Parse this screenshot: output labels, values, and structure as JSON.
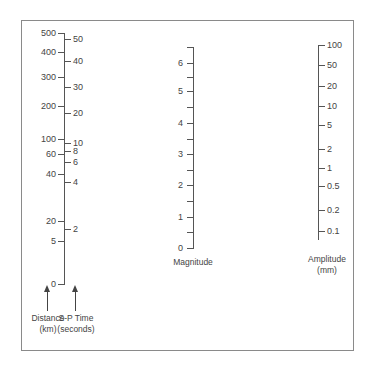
{
  "chart_data": {
    "type": "nomogram",
    "title": "",
    "scales": [
      {
        "name": "Distance",
        "unit": "km",
        "caption": "Distance\n(km)",
        "side": "left",
        "ticks": [
          {
            "label": "500",
            "y": 33
          },
          {
            "label": "400",
            "y": 52
          },
          {
            "label": "300",
            "y": 77
          },
          {
            "label": "200",
            "y": 106
          },
          {
            "label": "100",
            "y": 139
          },
          {
            "label": "60",
            "y": 154
          },
          {
            "label": "40",
            "y": 174
          },
          {
            "label": "20",
            "y": 221
          },
          {
            "label": "5",
            "y": 241
          },
          {
            "label": "0",
            "y": 284
          }
        ]
      },
      {
        "name": "S-P Time",
        "unit": "seconds",
        "caption": "S-P Time\n(seconds)",
        "side": "right",
        "ticks": [
          {
            "label": "50",
            "y": 39
          },
          {
            "label": "40",
            "y": 61
          },
          {
            "label": "30",
            "y": 87
          },
          {
            "label": "20",
            "y": 113
          },
          {
            "label": "10",
            "y": 143
          },
          {
            "label": "8",
            "y": 151
          },
          {
            "label": "6",
            "y": 162
          },
          {
            "label": "4",
            "y": 182
          },
          {
            "label": "2",
            "y": 229
          }
        ]
      },
      {
        "name": "Magnitude",
        "caption": "Magnitude",
        "ticks": [
          {
            "label": "6",
            "y": 63
          },
          {
            "label": "5",
            "y": 91
          },
          {
            "label": "4",
            "y": 123
          },
          {
            "label": "3",
            "y": 154
          },
          {
            "label": "2",
            "y": 185
          },
          {
            "label": "1",
            "y": 217
          },
          {
            "label": "0",
            "y": 248
          }
        ],
        "minor_ticks_y": [
          47,
          77,
          107,
          139,
          170,
          201,
          232
        ]
      },
      {
        "name": "Amplitude",
        "unit": "mm",
        "caption": "Amplitude\n(mm)",
        "ticks": [
          {
            "label": "100",
            "y": 45
          },
          {
            "label": "50",
            "y": 65
          },
          {
            "label": "20",
            "y": 86
          },
          {
            "label": "10",
            "y": 106
          },
          {
            "label": "5",
            "y": 125
          },
          {
            "label": "2",
            "y": 149
          },
          {
            "label": "1",
            "y": 168
          },
          {
            "label": "0.5",
            "y": 186
          },
          {
            "label": "0.2",
            "y": 210
          },
          {
            "label": "0.1",
            "y": 231
          }
        ]
      }
    ]
  },
  "labels": {
    "distance_caption_1": "Distance",
    "distance_caption_2": "(km)",
    "sp_caption_1": "S-P Time",
    "sp_caption_2": "(seconds)",
    "magnitude_caption": "Magnitude",
    "amplitude_caption_1": "Amplitude",
    "amplitude_caption_2": "(mm)"
  },
  "colors": {
    "axis": "#555555",
    "text": "#444444",
    "frame": "#8a8a8a"
  }
}
